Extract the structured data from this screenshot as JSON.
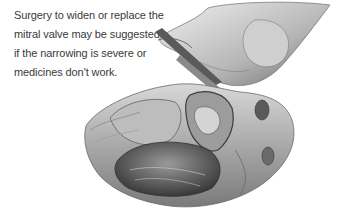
{
  "caption": {
    "lines": [
      "Surgery to widen or replace the",
      "mitral valve may be suggested",
      "if the narrowing is severe or",
      "medicines don't work."
    ]
  },
  "illustration": {
    "subject": "heart-surgery-mitral-valve-illustration",
    "style": "grayscale pencil drawing",
    "colors": {
      "light": "#e6e6e6",
      "mid": "#a8a8a8",
      "dark": "#4a4a4a",
      "text": "#3a3a3a"
    }
  }
}
